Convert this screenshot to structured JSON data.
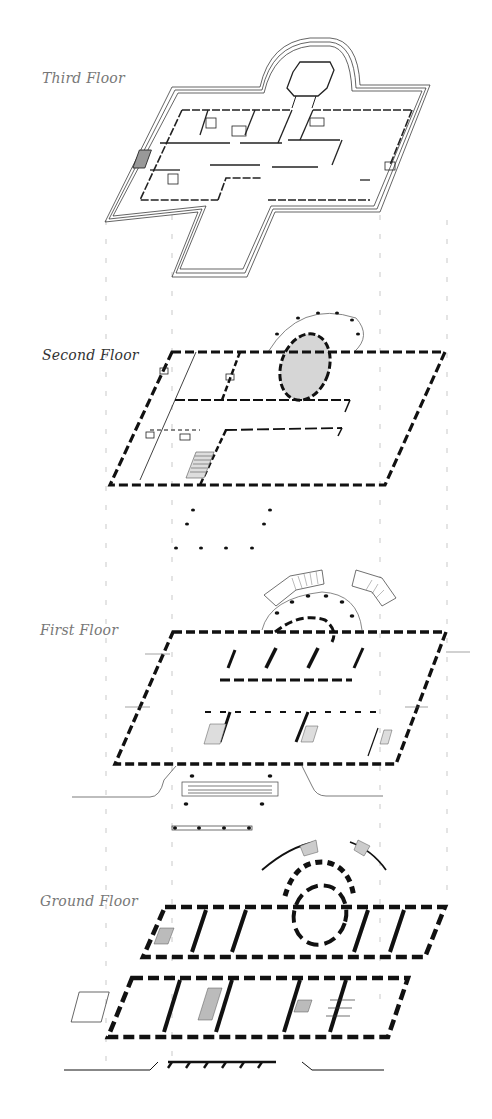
{
  "diagram": {
    "type": "exploded axonometric floor plans",
    "colors": {
      "ink": "#111111",
      "label_gray": "#777777",
      "label_dark": "#333333",
      "guide": "#bbbbbb",
      "fill_gray": "#d9d9d9",
      "background": "#ffffff"
    },
    "floors": [
      {
        "id": "third",
        "label": "Third Floor"
      },
      {
        "id": "second",
        "label": "Second Floor"
      },
      {
        "id": "first",
        "label": "First Floor"
      },
      {
        "id": "ground",
        "label": "Ground Floor"
      }
    ],
    "guides": {
      "x_positions": [
        106,
        172,
        380,
        447
      ],
      "style": "dashed vertical"
    }
  }
}
